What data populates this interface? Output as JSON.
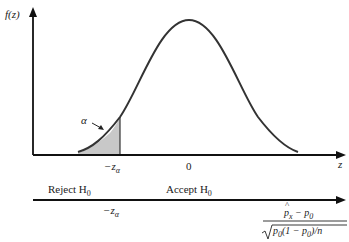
{
  "axes": {
    "y_label": "f(z)",
    "x_label": "z"
  },
  "curve": {
    "type": "standard-normal-density",
    "shaded_tail": "left",
    "shade_color": "#c8c8c8",
    "line_color": "#333333"
  },
  "tick_labels": {
    "critical": "−z",
    "critical_sub": "α",
    "zero": "0"
  },
  "annotations": {
    "alpha": "α"
  },
  "decision_axis": {
    "reject_label": "Reject H",
    "reject_sub": "0",
    "accept_label": "Accept H",
    "accept_sub": "0",
    "critical": "−z",
    "critical_sub": "α",
    "statistic": {
      "numerator_p": "p",
      "numerator_p_sub": "x",
      "numerator_rest": " − p",
      "numerator_rest_sub": "0",
      "denominator": "p",
      "denominator_sub": "0",
      "denominator_rest": "(1 − p",
      "denominator_rest_sub": "0",
      "denominator_tail": ")/n"
    }
  }
}
